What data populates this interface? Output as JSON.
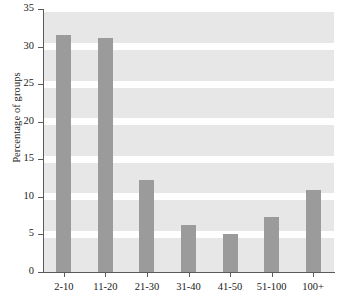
{
  "chart_data": {
    "type": "bar",
    "title": "",
    "xlabel": "",
    "ylabel": "Percentage of groups",
    "categories": [
      "2-10",
      "11-20",
      "21-30",
      "31-40",
      "41-50",
      "51-100",
      "100+"
    ],
    "values": [
      31.5,
      31.2,
      12.2,
      6.2,
      5.0,
      7.3,
      10.9
    ],
    "ylim": [
      0,
      35
    ],
    "yticks": [
      0,
      5,
      10,
      15,
      20,
      25,
      30,
      35
    ],
    "ytick_labels": [
      "0",
      "5",
      "10",
      "15",
      "20",
      "25",
      "30",
      "35"
    ],
    "grid": true,
    "grid_axis": "y",
    "legend": false,
    "bar_color": "#9b9b9b",
    "plot_background": "#e7e7e7",
    "gridline_color": "#ffffff",
    "axis_color": "#5a5a5a",
    "figure_background": "#ffffff"
  }
}
